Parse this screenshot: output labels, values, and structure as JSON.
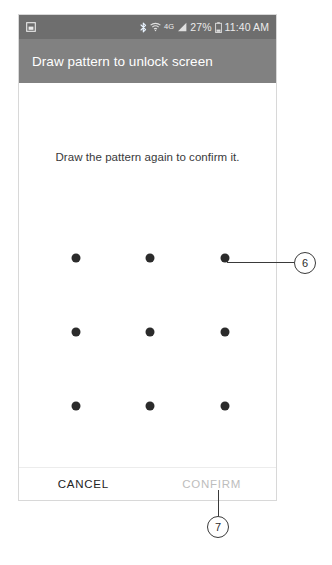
{
  "screen": {
    "status_bar": {
      "notification_icon": "screenshot-icon",
      "bluetooth_icon": "bluetooth-icon",
      "wifi_icon": "wifi-icon",
      "network_type": "4G",
      "signal_icon": "signal-bars-icon",
      "battery_percent": "27%",
      "battery_icon": "battery-icon",
      "clock": "11:40 AM"
    },
    "title_bar": {
      "title": "Draw pattern to unlock screen"
    },
    "body": {
      "instruction": "Draw the pattern again to confirm it.",
      "pattern": {
        "rows": 3,
        "columns": 3,
        "dot_color": "#2b2b2b",
        "dots": [
          {
            "row": 1,
            "col": 1
          },
          {
            "row": 1,
            "col": 2
          },
          {
            "row": 1,
            "col": 3
          },
          {
            "row": 2,
            "col": 1
          },
          {
            "row": 2,
            "col": 2
          },
          {
            "row": 2,
            "col": 3
          },
          {
            "row": 3,
            "col": 1
          },
          {
            "row": 3,
            "col": 2
          },
          {
            "row": 3,
            "col": 3
          }
        ]
      }
    },
    "buttons": {
      "cancel_label": "CANCEL",
      "confirm_label": "CONFIRM",
      "confirm_enabled": false
    }
  },
  "annotations": {
    "callouts": [
      {
        "number": "6",
        "target": "pattern-grid-top-right-dot"
      },
      {
        "number": "7",
        "target": "confirm-button"
      }
    ]
  },
  "colors": {
    "status_bar_bg": "#6e6e6e",
    "title_bar_bg": "#818181",
    "title_text": "#ffffff",
    "body_bg": "#ffffff",
    "instruction_text": "#39393b",
    "cancel_text": "#232323",
    "confirm_text_disabled": "#bdbdbd",
    "annotation_stroke": "#3a3a3a"
  }
}
